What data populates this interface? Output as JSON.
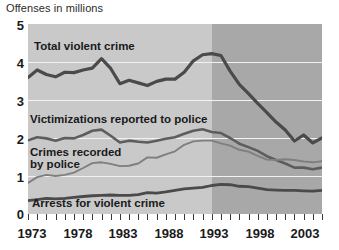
{
  "chart_data": {
    "type": "line",
    "title": "Offenses in millions",
    "xlabel": "",
    "ylabel": "Offenses in millions",
    "ylim": [
      0,
      5
    ],
    "xlim": [
      1973,
      2005
    ],
    "yticks": [
      "0",
      "1",
      "2",
      "3",
      "4",
      "5"
    ],
    "ytick_values": [
      0,
      1,
      2,
      3,
      4,
      5
    ],
    "xticks": [
      "1973",
      "1978",
      "1983",
      "1988",
      "1993",
      "1998",
      "2003"
    ],
    "xtick_values": [
      1973,
      1978,
      1983,
      1988,
      1993,
      1998,
      2003
    ],
    "grid": true,
    "legend": "inline-annotations",
    "shaded_region": {
      "from": 1993,
      "to": 2005,
      "light_color": "#c9c9c9",
      "dark_color": "#a8a8a8"
    },
    "x": [
      1973,
      1974,
      1975,
      1976,
      1977,
      1978,
      1979,
      1980,
      1981,
      1982,
      1983,
      1984,
      1985,
      1986,
      1987,
      1988,
      1989,
      1990,
      1991,
      1992,
      1993,
      1994,
      1995,
      1996,
      1997,
      1998,
      1999,
      2000,
      2001,
      2002,
      2003,
      2004,
      2005
    ],
    "series": [
      {
        "name": "Total violent crime",
        "color": "#4a4a4a",
        "values": [
          3.59,
          3.79,
          3.67,
          3.61,
          3.73,
          3.72,
          3.79,
          3.84,
          4.09,
          3.83,
          3.43,
          3.52,
          3.45,
          3.38,
          3.49,
          3.55,
          3.55,
          3.73,
          4.03,
          4.19,
          4.22,
          4.17,
          3.76,
          3.41,
          3.17,
          2.91,
          2.67,
          2.42,
          2.21,
          1.92,
          2.08,
          1.87,
          2.0
        ]
      },
      {
        "name": "Victimizations reported to police",
        "color": "#5d5d5d",
        "values": [
          1.94,
          2.02,
          1.99,
          1.93,
          2.0,
          1.99,
          2.08,
          2.19,
          2.22,
          2.06,
          1.88,
          1.93,
          1.9,
          1.88,
          1.93,
          1.98,
          2.02,
          2.11,
          2.19,
          2.23,
          2.16,
          2.13,
          2.0,
          1.85,
          1.76,
          1.66,
          1.52,
          1.42,
          1.33,
          1.22,
          1.22,
          1.18,
          1.22
        ]
      },
      {
        "name": "Crimes recorded by police",
        "color": "#7f7f7f",
        "values": [
          0.82,
          0.97,
          1.03,
          1.0,
          1.03,
          1.09,
          1.21,
          1.34,
          1.36,
          1.32,
          1.26,
          1.27,
          1.33,
          1.49,
          1.48,
          1.57,
          1.65,
          1.82,
          1.91,
          1.93,
          1.93,
          1.86,
          1.8,
          1.69,
          1.64,
          1.53,
          1.43,
          1.42,
          1.44,
          1.42,
          1.38,
          1.36,
          1.39
        ]
      },
      {
        "name": "Arrests for violent crime",
        "color": "#4a4a4a",
        "values": [
          0.35,
          0.38,
          0.41,
          0.4,
          0.41,
          0.44,
          0.46,
          0.48,
          0.49,
          0.5,
          0.49,
          0.49,
          0.51,
          0.56,
          0.55,
          0.58,
          0.62,
          0.66,
          0.68,
          0.7,
          0.75,
          0.78,
          0.77,
          0.73,
          0.72,
          0.68,
          0.64,
          0.63,
          0.62,
          0.62,
          0.61,
          0.6,
          0.62
        ]
      }
    ],
    "annotations": [
      {
        "id": "total",
        "text": "Total violent crime"
      },
      {
        "id": "victimizations",
        "text": "Victimizations reported to police"
      },
      {
        "id": "crimes_line1",
        "text": "Crimes recorded"
      },
      {
        "id": "crimes_line2",
        "text": "by police"
      },
      {
        "id": "arrests",
        "text": "Arrests for violent crime"
      }
    ]
  }
}
